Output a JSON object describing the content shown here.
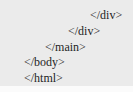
{
  "code_snippet": {
    "lines": [
      {
        "text": "</div>",
        "indent_px": 90,
        "top_px": 8
      },
      {
        "text": "</div>",
        "indent_px": 68,
        "top_px": 24
      },
      {
        "text": "</main>",
        "indent_px": 45,
        "top_px": 40
      },
      {
        "text": "</body>",
        "indent_px": 24,
        "top_px": 55
      },
      {
        "text": "</html>",
        "indent_px": 24,
        "top_px": 71
      }
    ]
  },
  "colors": {
    "background": "#ebebeb",
    "text": "#1e1e1e"
  }
}
